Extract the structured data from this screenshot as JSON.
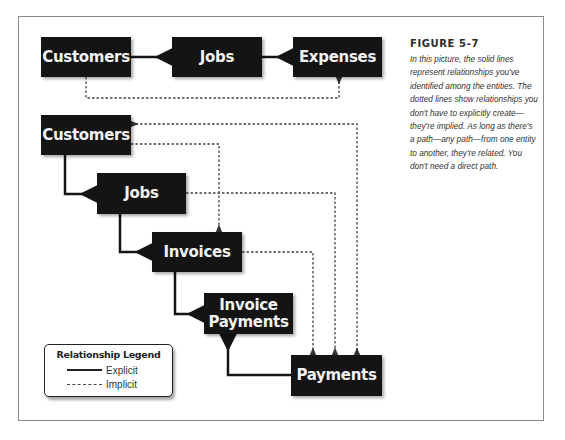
{
  "figure": {
    "label": "FIGURE 5-7",
    "caption": "In this picture, the solid lines represent relationships you've identified among the entities. The dotted lines show relationships you don't have to explicitly create—they're implied. As long as there's a path—any path—from one entity to another, they're related. You don't need a direct path."
  },
  "top_diagram": {
    "entities": [
      {
        "id": "customers",
        "label": "Customers"
      },
      {
        "id": "jobs",
        "label": "Jobs"
      },
      {
        "id": "expenses",
        "label": "Expenses"
      }
    ],
    "explicit": [
      [
        "customers",
        "jobs"
      ],
      [
        "jobs",
        "expenses"
      ]
    ],
    "implicit": [
      [
        "customers",
        "expenses"
      ]
    ]
  },
  "bottom_diagram": {
    "entities": [
      {
        "id": "customers",
        "label": "Customers"
      },
      {
        "id": "jobs",
        "label": "Jobs"
      },
      {
        "id": "invoices",
        "label": "Invoices"
      },
      {
        "id": "invoice_payments",
        "label": "Invoice Payments"
      },
      {
        "id": "payments",
        "label": "Payments"
      }
    ],
    "explicit": [
      [
        "customers",
        "jobs"
      ],
      [
        "jobs",
        "invoices"
      ],
      [
        "invoices",
        "invoice_payments"
      ],
      [
        "payments",
        "invoice_payments"
      ]
    ],
    "implicit": [
      [
        "customers",
        "payments"
      ],
      [
        "customers",
        "invoices"
      ],
      [
        "jobs",
        "payments"
      ],
      [
        "invoices",
        "payments"
      ]
    ]
  },
  "legend": {
    "title": "Relationship Legend",
    "items": [
      {
        "style": "solid",
        "label": "Explicit"
      },
      {
        "style": "dotted",
        "label": "Implicit"
      }
    ]
  }
}
